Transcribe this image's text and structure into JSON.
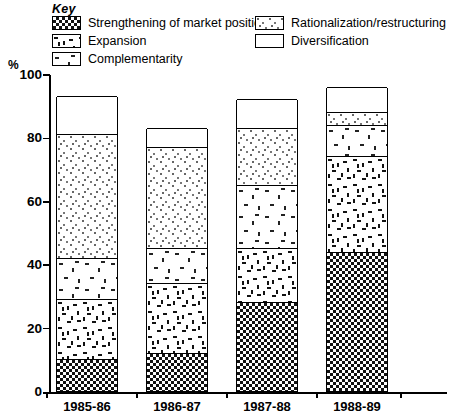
{
  "legend": {
    "title": "Key",
    "items": [
      {
        "label": "Strengthening of market position",
        "pattern": "checkerboard"
      },
      {
        "label": "Expansion",
        "pattern": "dense-dashes"
      },
      {
        "label": "Complementarity",
        "pattern": "sparse-dashes"
      },
      {
        "label": "Rationalization/restructuring",
        "pattern": "fine-dots"
      },
      {
        "label": "Diversification",
        "pattern": "blank"
      }
    ]
  },
  "axis": {
    "y_unit_label": "%",
    "y_ticks": [
      "0",
      "20",
      "40",
      "60",
      "80",
      "100"
    ],
    "y_min": 0,
    "y_max": 100
  },
  "chart_data": {
    "type": "bar",
    "subtype": "stacked",
    "title": "",
    "xlabel": "",
    "ylabel": "%",
    "ylim": [
      0,
      100
    ],
    "grid": false,
    "legend_position": "top",
    "categories": [
      "1985-86",
      "1986-87",
      "1987-88",
      "1988-89"
    ],
    "series": [
      {
        "name": "Strengthening of market position",
        "values": [
          10,
          12,
          28,
          44
        ]
      },
      {
        "name": "Expansion",
        "values": [
          19,
          22,
          17,
          30
        ]
      },
      {
        "name": "Complementarity",
        "values": [
          13,
          11,
          20,
          10
        ]
      },
      {
        "name": "Rationalization/restructuring",
        "values": [
          39,
          32,
          18,
          4
        ]
      },
      {
        "name": "Diversification",
        "values": [
          12,
          6,
          9,
          8
        ]
      }
    ],
    "totals": [
      93,
      83,
      92,
      96
    ]
  }
}
